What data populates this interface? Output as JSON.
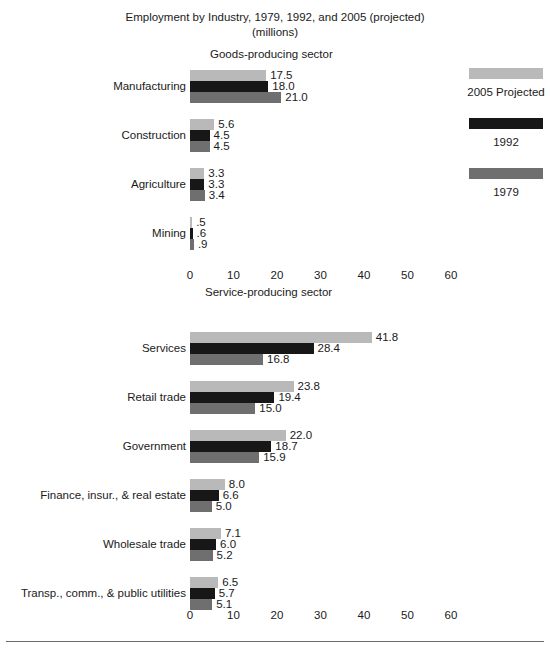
{
  "chart_data": {
    "type": "bar",
    "orientation": "horizontal",
    "title": "Employment by Industry, 1979, 1992, and 2005 (projected)",
    "subtitle": "(millions)",
    "xlabel": "",
    "ylabel": "",
    "xlim": [
      0,
      65
    ],
    "xticks": [
      "0",
      "10",
      "20",
      "30",
      "40",
      "50",
      "60"
    ],
    "xtick_values": [
      0,
      10,
      20,
      30,
      40,
      50,
      60
    ],
    "grid": false,
    "legend_position": "right",
    "series": [
      {
        "name": "2005 Projected",
        "color": "#b9b9b9"
      },
      {
        "name": "1992",
        "color": "#171717"
      },
      {
        "name": "1979",
        "color": "#6f6f6f"
      }
    ],
    "panels": [
      {
        "heading": "Goods-producing sector",
        "categories": [
          "Manufacturing",
          "Construction",
          "Agriculture",
          "Mining"
        ],
        "series": [
          {
            "name": "2005 Projected",
            "values": [
              17.5,
              5.6,
              3.3,
              0.5
            ],
            "labels": [
              "17.5",
              "5.6",
              "3.3",
              ".5"
            ]
          },
          {
            "name": "1992",
            "values": [
              18.0,
              4.5,
              3.3,
              0.6
            ],
            "labels": [
              "18.0",
              "4.5",
              "3.3",
              ".6"
            ]
          },
          {
            "name": "1979",
            "values": [
              21.0,
              4.5,
              3.4,
              0.9
            ],
            "labels": [
              "21.0",
              "4.5",
              "3.4",
              ".9"
            ]
          }
        ]
      },
      {
        "heading": "Service-producing sector",
        "categories": [
          "Services",
          "Retail trade",
          "Government",
          "Finance, insur., & real estate",
          "Wholesale trade",
          "Transp., comm., & public utilities"
        ],
        "series": [
          {
            "name": "2005 Projected",
            "values": [
              41.8,
              23.8,
              22.0,
              8.0,
              7.1,
              6.5
            ],
            "labels": [
              "41.8",
              "23.8",
              "22.0",
              "8.0",
              "7.1",
              "6.5"
            ]
          },
          {
            "name": "1992",
            "values": [
              28.4,
              19.4,
              18.7,
              6.6,
              6.0,
              5.7
            ],
            "labels": [
              "28.4",
              "19.4",
              "18.7",
              "6.6",
              "6.0",
              "5.7"
            ]
          },
          {
            "name": "1979",
            "values": [
              16.8,
              15.0,
              15.9,
              5.0,
              5.2,
              5.1
            ],
            "labels": [
              "16.8",
              "15.0",
              "15.9",
              "5.0",
              "5.2",
              "5.1"
            ]
          }
        ]
      }
    ]
  },
  "colors": {
    "series_2005": "#b9b9b9",
    "series_1992": "#171717",
    "series_1979": "#6f6f6f",
    "text": "#1a1a1a",
    "rule": "#6a6a6a",
    "background": "#ffffff"
  },
  "footer": {
    "source": ""
  }
}
